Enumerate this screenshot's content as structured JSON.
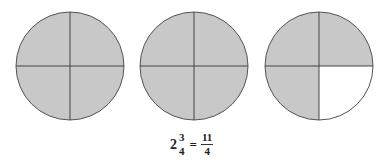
{
  "diagram": {
    "colors": {
      "shaded": "#c8c8c8",
      "unshaded": "#ffffff",
      "stroke": "#555555"
    },
    "circles": [
      {
        "id": "circle-1",
        "cx": 70,
        "cy": 66,
        "r": 54,
        "parts": 4,
        "shaded_quarters": [
          "tl",
          "tr",
          "bl",
          "br"
        ]
      },
      {
        "id": "circle-2",
        "cx": 194,
        "cy": 66,
        "r": 54,
        "parts": 4,
        "shaded_quarters": [
          "tl",
          "tr",
          "bl",
          "br"
        ]
      },
      {
        "id": "circle-3",
        "cx": 319,
        "cy": 66,
        "r": 54,
        "parts": 4,
        "shaded_quarters": [
          "tl",
          "tr",
          "bl"
        ]
      }
    ],
    "equation": {
      "whole": "2",
      "mixed_numerator": "3",
      "mixed_denominator": "4",
      "equals": "=",
      "improper_numerator": "11",
      "improper_denominator": "4"
    }
  }
}
